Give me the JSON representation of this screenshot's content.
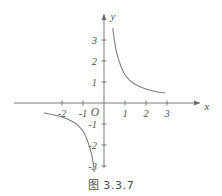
{
  "figure": {
    "caption": "图 3.3.7",
    "axis_labels": {
      "x": "x",
      "y": "y"
    },
    "origin_label": "O"
  },
  "chart_data": {
    "type": "line",
    "title": "图 3.3.7",
    "function": "y = 1/x",
    "xlabel": "x",
    "ylabel": "y",
    "xlim": [
      -2.9,
      3.4
    ],
    "ylim": [
      -3.6,
      3.7
    ],
    "grid": false,
    "legend": null,
    "x_ticks": [
      -2,
      -1,
      1,
      2,
      3
    ],
    "x_tick_labels": [
      "-2",
      "-1",
      "1",
      "2",
      "3"
    ],
    "y_ticks": [
      -3,
      -2,
      -1,
      1,
      2,
      3
    ],
    "y_tick_labels": [
      "-3",
      "-2",
      "-1",
      "1",
      "2",
      "3"
    ],
    "series": [
      {
        "name": "branch-quadrant-I",
        "x": [
          0.42,
          0.45,
          0.5,
          0.55,
          0.6,
          0.7,
          0.8,
          0.9,
          1.0,
          1.2,
          1.4,
          1.6,
          1.8,
          2.0,
          2.25,
          2.5,
          2.75,
          2.9
        ],
        "y": [
          3.55,
          3.3,
          2.95,
          2.65,
          2.4,
          2.05,
          1.76,
          1.52,
          1.33,
          1.1,
          0.94,
          0.83,
          0.74,
          0.67,
          0.6,
          0.54,
          0.5,
          0.48
        ]
      },
      {
        "name": "branch-quadrant-III",
        "x": [
          -2.85,
          -2.7,
          -2.5,
          -2.25,
          -2.0,
          -1.8,
          -1.6,
          -1.4,
          -1.2,
          -1.0,
          -0.9,
          -0.8,
          -0.7,
          -0.6,
          -0.55,
          -0.5,
          -0.46,
          -0.43
        ],
        "y": [
          -0.48,
          -0.5,
          -0.55,
          -0.6,
          -0.67,
          -0.74,
          -0.83,
          -0.94,
          -1.1,
          -1.33,
          -1.52,
          -1.76,
          -2.05,
          -2.4,
          -2.65,
          -2.95,
          -3.3,
          -3.55
        ]
      }
    ]
  },
  "colors": {
    "axis": "#6b6b6b",
    "curve": "#7a7a7a",
    "text": "#555555",
    "background": "#ffffff"
  }
}
